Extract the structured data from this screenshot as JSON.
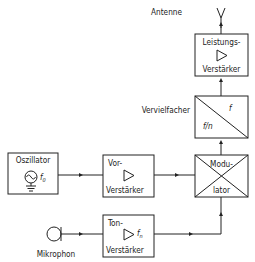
{
  "diagram": {
    "type": "block-diagram",
    "nodes": [
      {
        "id": "antenne",
        "label": "Antenne"
      },
      {
        "id": "leistung",
        "label_line1": "Leistungs-",
        "label_line2": "Verstärker",
        "symbol": "amplifier-triangle"
      },
      {
        "id": "vervielfacher",
        "label": "Vervielfacher",
        "upper": "f",
        "lower": "f/n",
        "symbol": "diagonal-divider"
      },
      {
        "id": "modulator",
        "label_line1": "Modu-",
        "label_line2": "lator",
        "symbol": "x-cross"
      },
      {
        "id": "oszillator",
        "label": "Oszillator",
        "freq": "f",
        "freq_sub": "0",
        "symbol": "sine-source-with-ground"
      },
      {
        "id": "vor",
        "label_line1": "Vor-",
        "label_line2": "Verstärker",
        "symbol": "amplifier-triangle"
      },
      {
        "id": "ton",
        "label_line1": "Ton-",
        "label_line2": "Verstärker",
        "freq": "f",
        "freq_sub": "n",
        "symbol": "amplifier-triangle"
      },
      {
        "id": "mikrophon",
        "label": "Mikrophon",
        "symbol": "microphone-circle"
      }
    ],
    "edges": [
      {
        "from": "oszillator",
        "to": "vor"
      },
      {
        "from": "vor",
        "to": "modulator"
      },
      {
        "from": "mikrophon",
        "to": "ton"
      },
      {
        "from": "ton",
        "to": "modulator"
      },
      {
        "from": "modulator",
        "to": "vervielfacher"
      },
      {
        "from": "vervielfacher",
        "to": "leistung"
      },
      {
        "from": "leistung",
        "to": "antenne"
      }
    ]
  }
}
